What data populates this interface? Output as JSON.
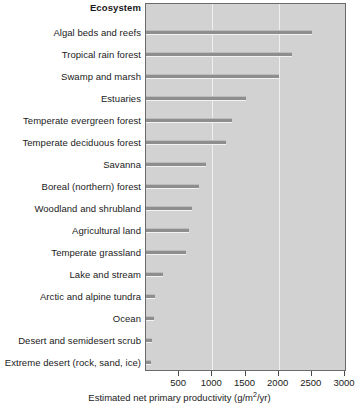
{
  "chart_data": {
    "type": "bar",
    "orientation": "horizontal",
    "title": "",
    "header_label": "Ecosystem",
    "xlabel": "Estimated net primary productivity (g/m2/yr)",
    "xlabel_prefix": "Estimated net primary productivity (g/m",
    "xlabel_exponent": "2",
    "xlabel_suffix": "/yr)",
    "ylabel": "Ecosystem",
    "xlim": [
      0,
      3000
    ],
    "ylim": null,
    "grid": "vertical-major",
    "legend": "none",
    "tick_values": [
      500,
      1000,
      1500,
      2000,
      2500,
      3000
    ],
    "tick_labels": [
      "500",
      "1000",
      "1500",
      "2000",
      "2500",
      "3000"
    ],
    "gridline_values": [
      1000,
      2000
    ],
    "categories": [
      "Algal beds and reefs",
      "Tropical rain forest",
      "Swamp and marsh",
      "Estuaries",
      "Temperate evergreen forest",
      "Temperate deciduous forest",
      "Savanna",
      "Boreal (northern) forest",
      "Woodland and shrubland",
      "Agricultural land",
      "Temperate grassland",
      "Lake and stream",
      "Arctic and alpine tundra",
      "Ocean",
      "Desert and semidesert scrub",
      "Extreme desert (rock, sand, ice)"
    ],
    "values": [
      2500,
      2200,
      2000,
      1500,
      1300,
      1200,
      900,
      800,
      700,
      650,
      600,
      250,
      140,
      125,
      90,
      70
    ],
    "colors": {
      "plot_background": "#d2d2d2",
      "bar": "#8e8e8e",
      "gridline": "#efefef",
      "frame": "#6a6a6a",
      "text": "#1a1a1a",
      "page_background": "#ffffff"
    }
  }
}
